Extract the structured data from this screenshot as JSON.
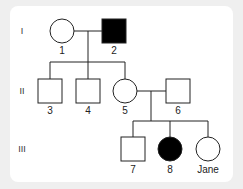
{
  "diagram": {
    "type": "pedigree",
    "generations": [
      {
        "numeral": "I",
        "y": 31
      },
      {
        "numeral": "II",
        "y": 91
      },
      {
        "numeral": "III",
        "y": 149
      }
    ],
    "individuals": [
      {
        "id": "1",
        "label": "1",
        "sex": "female",
        "affected": false,
        "generation": "I"
      },
      {
        "id": "2",
        "label": "2",
        "sex": "male",
        "affected": true,
        "generation": "I"
      },
      {
        "id": "3",
        "label": "3",
        "sex": "male",
        "affected": false,
        "generation": "II"
      },
      {
        "id": "4",
        "label": "4",
        "sex": "male",
        "affected": false,
        "generation": "II"
      },
      {
        "id": "5",
        "label": "5",
        "sex": "female",
        "affected": false,
        "generation": "II"
      },
      {
        "id": "6",
        "label": "6",
        "sex": "male",
        "affected": false,
        "generation": "II"
      },
      {
        "id": "7",
        "label": "7",
        "sex": "male",
        "affected": false,
        "generation": "III"
      },
      {
        "id": "8",
        "label": "8",
        "sex": "female",
        "affected": true,
        "generation": "III"
      },
      {
        "id": "jane",
        "label": "Jane",
        "sex": "female",
        "affected": false,
        "generation": "III"
      }
    ],
    "matings": [
      {
        "partners": [
          "1",
          "2"
        ],
        "children": [
          "3",
          "4",
          "5"
        ]
      },
      {
        "partners": [
          "5",
          "6"
        ],
        "children": [
          "7",
          "8",
          "jane"
        ]
      }
    ],
    "colors": {
      "line": "#222222",
      "affected_fill": "#000000",
      "unaffected_fill": "#ffffff",
      "card": "#ffffff",
      "background": "#efefef"
    }
  }
}
